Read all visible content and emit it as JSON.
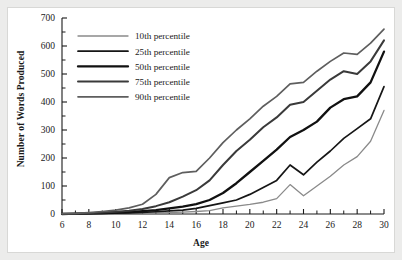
{
  "figure": {
    "background_color": "#ffffff",
    "frame_color": "#ececeb"
  },
  "chart_data": {
    "type": "line",
    "title": "",
    "xlabel": "Age",
    "ylabel": "Number of Words Produced",
    "xlim": [
      6,
      30
    ],
    "ylim": [
      0,
      700
    ],
    "xticks": [
      6,
      8,
      10,
      12,
      14,
      16,
      18,
      20,
      22,
      24,
      26,
      28,
      30
    ],
    "xtick_labels": [
      "6",
      "8",
      "10",
      "12",
      "14",
      "16",
      "18",
      "20",
      "22",
      "24",
      "26",
      "28",
      "30"
    ],
    "x_minor_ticks": [
      7,
      9,
      11,
      13,
      15,
      17,
      19,
      21,
      23,
      25,
      27,
      29
    ],
    "yticks": [
      0,
      100,
      200,
      300,
      400,
      500,
      600,
      700
    ],
    "ytick_labels": [
      "0",
      "100",
      "200",
      "300",
      "400",
      "500",
      "600",
      "700"
    ],
    "y_minor_ticks": [
      50,
      150,
      250,
      350,
      450,
      550,
      650
    ],
    "grid": false,
    "legend_position": "upper-left-inside",
    "x": [
      6,
      7,
      8,
      9,
      10,
      11,
      12,
      13,
      14,
      15,
      16,
      17,
      18,
      19,
      20,
      21,
      22,
      23,
      24,
      25,
      26,
      27,
      28,
      29,
      30
    ],
    "series": [
      {
        "name": "10th percentile",
        "color": "#8a8a8a",
        "width": 1.3,
        "values": [
          0,
          0,
          1,
          1,
          2,
          2,
          3,
          4,
          5,
          7,
          9,
          12,
          22,
          28,
          34,
          42,
          55,
          105,
          65,
          100,
          135,
          175,
          205,
          260,
          370
        ]
      },
      {
        "name": "25th percentile",
        "color": "#161616",
        "width": 1.7,
        "values": [
          0,
          0,
          1,
          2,
          3,
          4,
          6,
          8,
          11,
          14,
          20,
          30,
          40,
          50,
          70,
          95,
          120,
          175,
          140,
          185,
          225,
          270,
          305,
          340,
          455
        ]
      },
      {
        "name": "50th percentile",
        "color": "#111111",
        "width": 2.3,
        "values": [
          0,
          1,
          2,
          3,
          5,
          7,
          10,
          14,
          20,
          26,
          35,
          50,
          75,
          110,
          150,
          190,
          230,
          275,
          300,
          330,
          380,
          410,
          420,
          470,
          580
        ]
      },
      {
        "name": "75th percentile",
        "color": "#3a3a3a",
        "width": 2.0,
        "values": [
          0,
          1,
          3,
          5,
          8,
          12,
          18,
          28,
          42,
          62,
          85,
          120,
          175,
          225,
          265,
          310,
          345,
          390,
          400,
          440,
          480,
          510,
          500,
          545,
          620
        ]
      },
      {
        "name": "90th percentile",
        "color": "#5e5e5e",
        "width": 1.7,
        "values": [
          1,
          2,
          5,
          9,
          14,
          22,
          35,
          70,
          130,
          148,
          152,
          200,
          255,
          300,
          340,
          385,
          420,
          465,
          470,
          510,
          545,
          575,
          570,
          610,
          660
        ]
      }
    ]
  },
  "legend": {
    "entries": [
      {
        "label": "10th percentile"
      },
      {
        "label": "25th percentile"
      },
      {
        "label": "50th percentile"
      },
      {
        "label": "75th percentile"
      },
      {
        "label": "90th percentile"
      }
    ]
  }
}
